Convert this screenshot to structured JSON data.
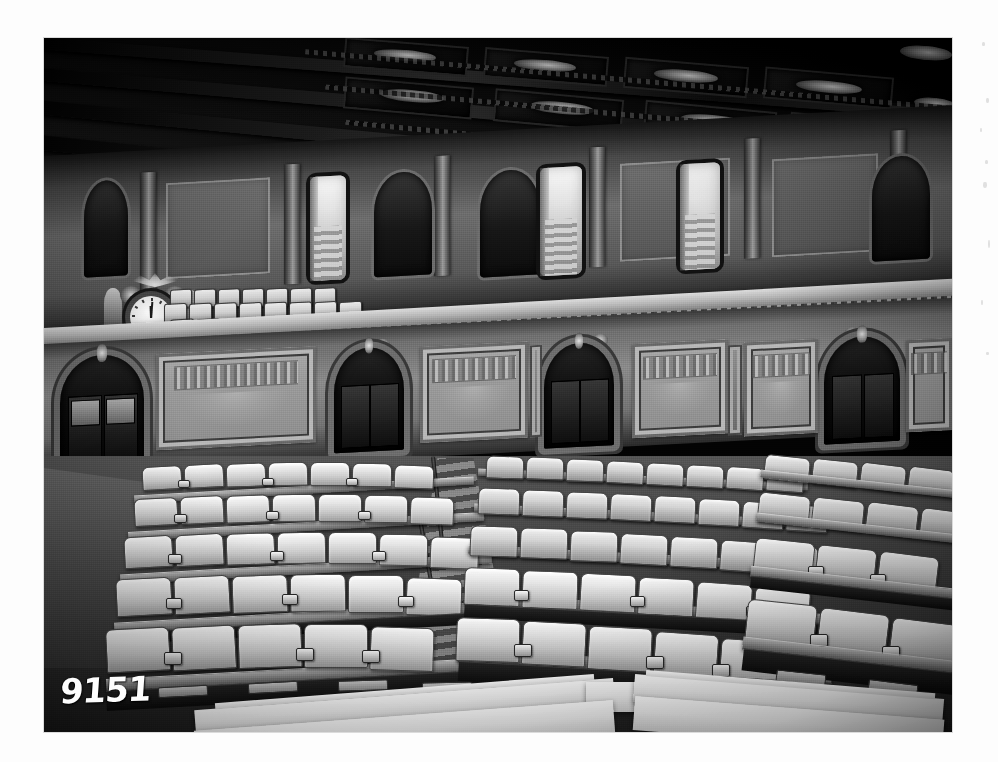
{
  "page": {
    "medium": "black-and-white photographic print on white mount",
    "width": 998,
    "height": 762,
    "background_color": "#fdfdfd"
  },
  "photograph": {
    "subject": "Empty legislative assembly chamber interior",
    "identified_as": "United States House of Representatives Chamber",
    "orientation": "landscape",
    "left": 44,
    "top": 38,
    "width": 908,
    "height": 694,
    "tone": "monochrome silver gelatin",
    "condition": "visible film grain, soft focus at edges, darkened upper region"
  },
  "annotation": {
    "negative_number": "9151",
    "style": "white hand-scratched digits on the negative",
    "position": "lower-left corner of the photograph"
  },
  "scene": {
    "ceiling": {
      "name": "coffered ceiling",
      "description": "Deeply recessed rectangular coffers in dark carved wood with dentil moldings and bright skylight panels",
      "coffer_count": 12,
      "beam_count": 6,
      "tone": "very dark, near black"
    },
    "cornice": {
      "name": "entablature cornice",
      "description": "Dentil-course molding band separating ceiling from gallery wall"
    },
    "gallery_level": {
      "name": "upper public gallery",
      "wall_description": "Paneled wall with pilasters, blind arched niches and open doorways",
      "arched_niches": 4,
      "open_doorways": 3,
      "doorway_note": "Bright daylight and a staircase visible through the open doors",
      "seat_rows": 4,
      "seat_description": "Tiered rows of light upholstered gallery chairs behind a balustrade",
      "rail_description": "Fretwork balustrade rail running the width of the chamber"
    },
    "clock": {
      "name": "chamber clock",
      "description": "Ornate round clock set in a carved surround with an eagle above and allegorical figures flanking",
      "location": "upper left, on the gallery front",
      "hands_reading": "approximately 12:00"
    },
    "main_wall": {
      "name": "lower chamber wall",
      "description": "Stone-toned wall with arched doorways and large ornamented rectangular panels",
      "arched_doorways": 4,
      "decorated_panels": 5,
      "door_description": "Dark paneled double doors with glazed upper lights set in arched surrounds"
    },
    "floor_seating": {
      "name": "members' desks and chairs",
      "description": "Curved tiers of pale upholstered armchairs arranged in concentric arcs on stepped platforms",
      "visible_rows": 9,
      "blocks": 3,
      "aisle_description": "Stepped central aisle with metal handrail dividing the seating blocks",
      "platform_description": "Wooden tier decks with dark risers and rectangular floor vents"
    },
    "foreground": {
      "name": "rostrum platform",
      "description": "Light-colored stepped dais edge crossing the bottom of the frame"
    },
    "floor": {
      "name": "chamber floor",
      "description": "Open carpeted aisle area at the left, mid-grey tone"
    }
  },
  "palette": {
    "mount_white": "#fdfdfd",
    "shadow_black": "#0a0a0a",
    "deep_grey": "#2c2c2c",
    "mid_grey": "#6f6f6f",
    "wall_grey": "#8f8f8f",
    "upholstery_light": "#e6e6e6",
    "highlight_white": "#f6f6f6"
  }
}
